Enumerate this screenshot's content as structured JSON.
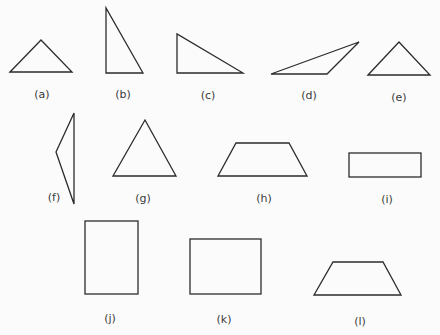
{
  "figure": {
    "stroke_color": "#2b2b2b",
    "label_color": "#3a3a3a",
    "shapes": [
      {
        "id": "a",
        "label": "(a)",
        "kind": "triangle",
        "subtype": "obtuse isosceles-like"
      },
      {
        "id": "b",
        "label": "(b)",
        "kind": "triangle",
        "subtype": "right"
      },
      {
        "id": "c",
        "label": "(c)",
        "kind": "triangle",
        "subtype": "right"
      },
      {
        "id": "d",
        "label": "(d)",
        "kind": "triangle",
        "subtype": "obtuse"
      },
      {
        "id": "e",
        "label": "(e)",
        "kind": "triangle",
        "subtype": "isosceles"
      },
      {
        "id": "f",
        "label": "(f)",
        "kind": "triangle",
        "subtype": "obtuse"
      },
      {
        "id": "g",
        "label": "(g)",
        "kind": "triangle",
        "subtype": "equilateral"
      },
      {
        "id": "h",
        "label": "(h)",
        "kind": "trapezoid",
        "subtype": "isosceles"
      },
      {
        "id": "i",
        "label": "(i)",
        "kind": "rectangle",
        "subtype": "wide"
      },
      {
        "id": "j",
        "label": "(j)",
        "kind": "rectangle",
        "subtype": "tall"
      },
      {
        "id": "k",
        "label": "(k)",
        "kind": "rectangle",
        "subtype": "near-square"
      },
      {
        "id": "l",
        "label": "(l)",
        "kind": "trapezoid",
        "subtype": "isosceles"
      }
    ]
  }
}
